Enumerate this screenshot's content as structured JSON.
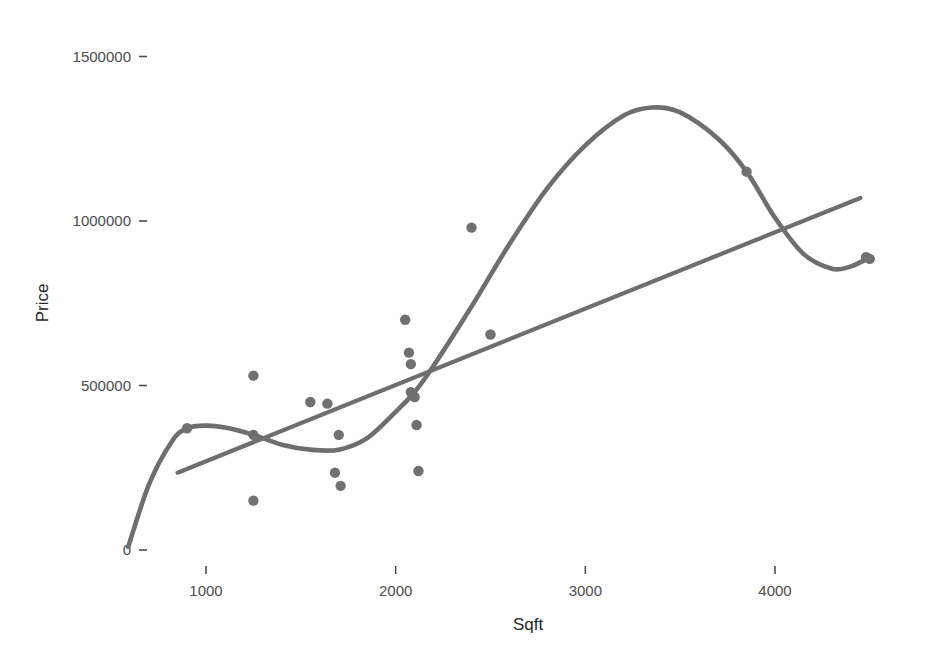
{
  "chart_data": {
    "type": "scatter",
    "title": "",
    "xlabel": "Sqft",
    "ylabel": "Price",
    "xlim": [
      500,
      4700
    ],
    "ylim": [
      -60000,
      1560000
    ],
    "grid": false,
    "legend": null,
    "x_ticks": [
      1000,
      2000,
      3000,
      4000
    ],
    "x_tick_labels": [
      "1000",
      "2000",
      "3000",
      "4000"
    ],
    "y_ticks": [
      0,
      500000,
      1000000,
      1500000
    ],
    "y_tick_labels": [
      "0",
      "500000",
      "1000000",
      "1500000"
    ],
    "point_color": "#707070",
    "line_color": "#6e6e6e",
    "background_color": "#fefefe",
    "points": [
      {
        "x": 900,
        "y": 370000
      },
      {
        "x": 1250,
        "y": 530000
      },
      {
        "x": 1250,
        "y": 350000
      },
      {
        "x": 1250,
        "y": 150000
      },
      {
        "x": 1550,
        "y": 450000
      },
      {
        "x": 1640,
        "y": 445000
      },
      {
        "x": 1700,
        "y": 350000
      },
      {
        "x": 1680,
        "y": 235000
      },
      {
        "x": 1710,
        "y": 195000
      },
      {
        "x": 2050,
        "y": 700000
      },
      {
        "x": 2070,
        "y": 600000
      },
      {
        "x": 2080,
        "y": 565000
      },
      {
        "x": 2080,
        "y": 480000
      },
      {
        "x": 2100,
        "y": 465000
      },
      {
        "x": 2110,
        "y": 380000
      },
      {
        "x": 2120,
        "y": 240000
      },
      {
        "x": 2400,
        "y": 980000
      },
      {
        "x": 2500,
        "y": 655000
      },
      {
        "x": 3850,
        "y": 1150000
      },
      {
        "x": 4480,
        "y": 890000
      },
      {
        "x": 4500,
        "y": 885000
      }
    ],
    "series": [
      {
        "name": "linear-fit",
        "type": "line",
        "x_start": 850,
        "x_end": 4450,
        "y_start": 235000,
        "y_end": 1070000
      },
      {
        "name": "loess-smooth",
        "type": "line",
        "x": [
          590,
          700,
          820,
          900,
          1000,
          1100,
          1250,
          1400,
          1550,
          1700,
          1850,
          2000,
          2100,
          2200,
          2400,
          2600,
          2800,
          3000,
          3200,
          3350,
          3500,
          3700,
          3850,
          4000,
          4150,
          4300,
          4400,
          4500
        ],
        "y": [
          10000,
          200000,
          330000,
          370000,
          378000,
          372000,
          350000,
          320000,
          305000,
          305000,
          340000,
          420000,
          480000,
          560000,
          740000,
          930000,
          1100000,
          1230000,
          1320000,
          1345000,
          1330000,
          1250000,
          1150000,
          1010000,
          900000,
          855000,
          862000,
          890000
        ]
      }
    ]
  },
  "axes": {
    "x_title": "Sqft",
    "y_title": "Price"
  }
}
